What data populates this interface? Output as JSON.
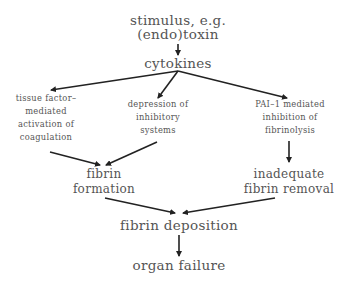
{
  "diagram": {
    "nodes": {
      "stimulus": {
        "lines": [
          "stimulus, e.g.",
          "(endo)toxin"
        ]
      },
      "cytokines": {
        "lines": [
          "cytokines"
        ]
      },
      "tissue_factor": {
        "lines": [
          "tissue factor–",
          "mediated",
          "activation of",
          "coagulation"
        ]
      },
      "depression": {
        "lines": [
          "depression of",
          "inhibitory",
          "systems"
        ]
      },
      "pai1": {
        "lines": [
          "PAI–1 mediated",
          "inhibition of",
          "fibrinolysis"
        ]
      },
      "fibrin_formation": {
        "lines": [
          "fibrin",
          "formation"
        ]
      },
      "inadequate_removal": {
        "lines": [
          "inadequate",
          "fibrin removal"
        ]
      },
      "fibrin_deposition": {
        "lines": [
          "fibrin deposition"
        ]
      },
      "organ_failure": {
        "lines": [
          "organ failure"
        ]
      }
    },
    "edges": [
      {
        "from": "stimulus",
        "to": "cytokines"
      },
      {
        "from": "cytokines",
        "to": "tissue_factor"
      },
      {
        "from": "cytokines",
        "to": "depression"
      },
      {
        "from": "cytokines",
        "to": "pai1"
      },
      {
        "from": "tissue_factor",
        "to": "fibrin_formation"
      },
      {
        "from": "depression",
        "to": "fibrin_formation"
      },
      {
        "from": "pai1",
        "to": "inadequate_removal"
      },
      {
        "from": "fibrin_formation",
        "to": "fibrin_deposition"
      },
      {
        "from": "inadequate_removal",
        "to": "fibrin_deposition"
      },
      {
        "from": "fibrin_deposition",
        "to": "organ_failure"
      }
    ],
    "colors": {
      "text": "#555555",
      "arrow": "#222222"
    }
  }
}
